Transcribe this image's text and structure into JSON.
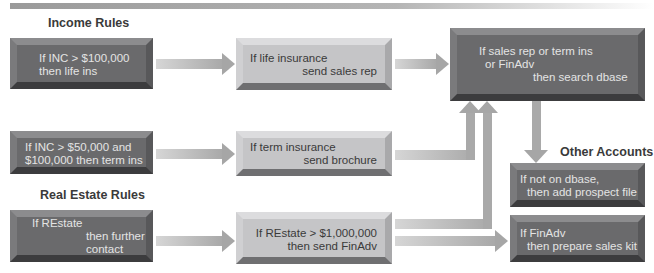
{
  "headings": {
    "income_rules": "Income Rules",
    "real_estate_rules": "Real Estate Rules",
    "other_accounts": "Other Accounts"
  },
  "boxes": {
    "inc_100k": [
      "If INC > $100,000",
      "then life ins"
    ],
    "life_insurance": [
      "If life insurance",
      "send sales rep"
    ],
    "search_dbase": [
      "If sales rep or term ins",
      "or FinAdv",
      "then search dbase"
    ],
    "inc_50k": [
      "If INC > $50,000 and",
      "$100,000 then term ins"
    ],
    "term_insurance": [
      "If term insurance",
      "send brochure"
    ],
    "restate": [
      "If REstate",
      "then further",
      "contact"
    ],
    "restate_1m": [
      "If REstate > $1,000,000",
      "then send FinAdv"
    ],
    "not_on_dbase": [
      "If not on dbase,",
      "then add prospect file"
    ],
    "finadv": [
      "If FinAdv",
      "then prepare sales kit"
    ]
  },
  "colors": {
    "dark_box": "#6a6a6c",
    "light_box": "#c5c5c7",
    "arrow": "#a9a9a9",
    "heading_text": "#3a3a3a"
  }
}
